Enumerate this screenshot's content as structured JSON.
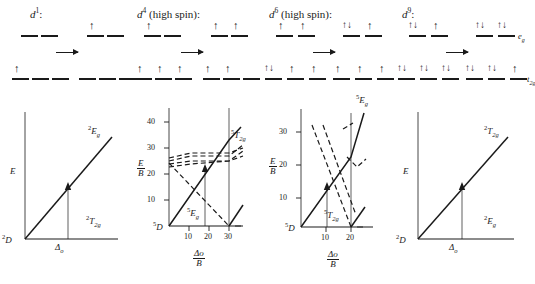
{
  "figure": {
    "background": "#ffffff",
    "ink": "#1a1a1a"
  },
  "columns": [
    {
      "id": "d1",
      "title_base": "d",
      "title_sup": "1",
      "title_suffix": ":",
      "arrow": "right-arrow",
      "configs": {
        "ground": {
          "eg": [
            "",
            ""
          ],
          "t2g": [
            "up",
            "",
            ""
          ]
        },
        "excited": {
          "eg": [
            "up",
            ""
          ],
          "t2g": [
            "",
            "",
            ""
          ]
        }
      },
      "orbital_labels": {
        "eg": "",
        "t2g": ""
      },
      "plot": {
        "type": "line",
        "ylabel": "E",
        "xlabel": "",
        "ground_term": "2D",
        "ground_term_sup": "2",
        "ground_term_base": "D",
        "upper_state_sup": "2",
        "upper_state_base": "E",
        "upper_state_sub": "g",
        "lower_state_sup": "2",
        "lower_state_base": "T",
        "lower_state_sub": "2g",
        "transition_arrow_label": "Δ",
        "transition_arrow_sub": "o",
        "yticks": [],
        "xticks": [],
        "series": [
          {
            "name": "2Eg",
            "style": "solid",
            "points": [
              [
                0,
                0
              ],
              [
                1,
                1
              ]
            ]
          },
          {
            "name": "2T2g",
            "style": "solid-baseline",
            "points": [
              [
                0,
                0
              ],
              [
                1,
                0
              ]
            ]
          }
        ]
      }
    },
    {
      "id": "d4",
      "title_base": "d",
      "title_sup": "4",
      "title_suffix": " (high spin):",
      "arrow": "right-arrow",
      "configs": {
        "ground": {
          "eg": [
            "up",
            ""
          ],
          "t2g": [
            "up",
            "up",
            "up"
          ]
        },
        "excited": {
          "eg": [
            "up",
            "up"
          ],
          "t2g": [
            "up",
            "up",
            ""
          ]
        }
      },
      "orbital_labels": {
        "eg": "",
        "t2g": ""
      },
      "plot": {
        "type": "line",
        "ylabel_num": "E",
        "ylabel_den": "B",
        "xlabel_num": "Δo",
        "xlabel_den": "B",
        "ground_term_sup": "5",
        "ground_term_base": "D",
        "upper_state_sup": "5",
        "upper_state_base": "T",
        "upper_state_sub": "2g",
        "lower_state_sup": "5",
        "lower_state_base": "E",
        "lower_state_sub": "g",
        "yticks": [
          10,
          20,
          30,
          40
        ],
        "xticks": [
          10,
          20,
          30
        ],
        "ylim": [
          0,
          45
        ],
        "xlim": [
          0,
          33
        ],
        "crossover_x": 27,
        "series": [
          {
            "name": "5Eg",
            "style": "solid",
            "points": [
              [
                0,
                0
              ],
              [
                30,
                33
              ],
              [
                32,
                38
              ]
            ]
          },
          {
            "name": "5T2g-baseline",
            "style": "solid-baseline",
            "points": [
              [
                0,
                0
              ],
              [
                27,
                0
              ]
            ]
          },
          {
            "name": "low-spin-ground",
            "style": "solid",
            "points": [
              [
                27,
                0
              ],
              [
                32,
                8
              ]
            ]
          },
          {
            "name": "descending-term",
            "style": "dashed",
            "points": [
              [
                0,
                24
              ],
              [
                27,
                0
              ]
            ]
          },
          {
            "name": "flat-band-1",
            "style": "dashed",
            "points": [
              [
                0,
                26
              ],
              [
                14,
                28
              ],
              [
                27,
                28
              ],
              [
                32,
                30
              ]
            ]
          },
          {
            "name": "flat-band-2",
            "style": "dashed",
            "points": [
              [
                0,
                25
              ],
              [
                14,
                27
              ],
              [
                27,
                27
              ],
              [
                32,
                31
              ]
            ]
          },
          {
            "name": "flat-band-3",
            "style": "dashed",
            "points": [
              [
                0,
                24
              ],
              [
                14,
                25
              ],
              [
                27,
                25
              ],
              [
                32,
                29
              ]
            ]
          },
          {
            "name": "flat-band-4",
            "style": "dashed",
            "points": [
              [
                0,
                23
              ],
              [
                14,
                24
              ],
              [
                27,
                25
              ],
              [
                32,
                27
              ]
            ]
          }
        ]
      }
    },
    {
      "id": "d6",
      "title_base": "d",
      "title_sup": "6",
      "title_suffix": " (high spin):",
      "arrow": "right-arrow",
      "configs": {
        "ground": {
          "eg": [
            "up",
            "up"
          ],
          "t2g": [
            "updown",
            "up",
            "up"
          ]
        },
        "excited": {
          "eg": [
            "updown",
            "up"
          ],
          "t2g": [
            "up",
            "up",
            "up"
          ]
        }
      },
      "orbital_labels": {
        "eg": "",
        "t2g": ""
      },
      "plot": {
        "type": "line",
        "ylabel_num": "E",
        "ylabel_den": "B",
        "xlabel_num": "Δo",
        "xlabel_den": "B",
        "ground_term_sup": "5",
        "ground_term_base": "D",
        "upper_state_sup": "5",
        "upper_state_base": "E",
        "upper_state_sub": "g",
        "lower_state_sup": "5",
        "lower_state_base": "T",
        "lower_state_sub": "2g",
        "yticks": [
          10,
          20,
          30
        ],
        "xticks": [
          10,
          20
        ],
        "ylim": [
          0,
          34
        ],
        "xlim": [
          0,
          23
        ],
        "crossover_x": 20,
        "series": [
          {
            "name": "5Eg",
            "style": "solid",
            "points": [
              [
                0,
                0
              ],
              [
                20,
                21
              ],
              [
                23,
                32
              ]
            ]
          },
          {
            "name": "5T2g-baseline",
            "style": "solid-baseline",
            "points": [
              [
                0,
                0
              ],
              [
                20,
                0
              ]
            ]
          },
          {
            "name": "low-spin-ground",
            "style": "solid",
            "points": [
              [
                20,
                0
              ],
              [
                23,
                6
              ]
            ]
          },
          {
            "name": "descending-1",
            "style": "dashed",
            "points": [
              [
                4,
                32
              ],
              [
                20,
                0
              ]
            ]
          },
          {
            "name": "descending-2",
            "style": "dashed",
            "points": [
              [
                8,
                32
              ],
              [
                20,
                4
              ]
            ]
          },
          {
            "name": "upper-dash",
            "style": "dashed",
            "points": [
              [
                17,
                30
              ],
              [
                20,
                31
              ]
            ]
          },
          {
            "name": "dip-dash",
            "style": "dashed",
            "points": [
              [
                18,
                21
              ],
              [
                21,
                18
              ],
              [
                23,
                20
              ]
            ]
          }
        ]
      }
    },
    {
      "id": "d9",
      "title_base": "d",
      "title_sup": "9",
      "title_suffix": ":",
      "arrow": "right-arrow",
      "configs": {
        "ground": {
          "eg": [
            "updown",
            "up"
          ],
          "t2g": [
            "updown",
            "updown",
            "updown"
          ]
        },
        "excited": {
          "eg": [
            "updown",
            "updown"
          ],
          "t2g": [
            "updown",
            "updown",
            "up"
          ]
        }
      },
      "orbital_labels": {
        "eg": "e",
        "eg_sub": "g",
        "t2g": "t",
        "t2g_sub": "2g"
      },
      "plot": {
        "type": "line",
        "ylabel": "E",
        "xlabel": "",
        "ground_term_sup": "2",
        "ground_term_base": "D",
        "upper_state_sup": "2",
        "upper_state_base": "T",
        "upper_state_sub": "2g",
        "lower_state_sup": "2",
        "lower_state_base": "E",
        "lower_state_sub": "g",
        "transition_arrow_label": "Δ",
        "transition_arrow_sub": "o",
        "yticks": [],
        "xticks": [],
        "series": [
          {
            "name": "2T2g",
            "style": "solid",
            "points": [
              [
                0,
                0
              ],
              [
                1,
                1
              ]
            ]
          },
          {
            "name": "2Eg",
            "style": "solid-baseline",
            "points": [
              [
                0,
                0
              ],
              [
                1,
                0
              ]
            ]
          }
        ]
      }
    }
  ],
  "glyphs": {
    "up": "↑",
    "updown": "↑↓",
    "empty": ""
  }
}
